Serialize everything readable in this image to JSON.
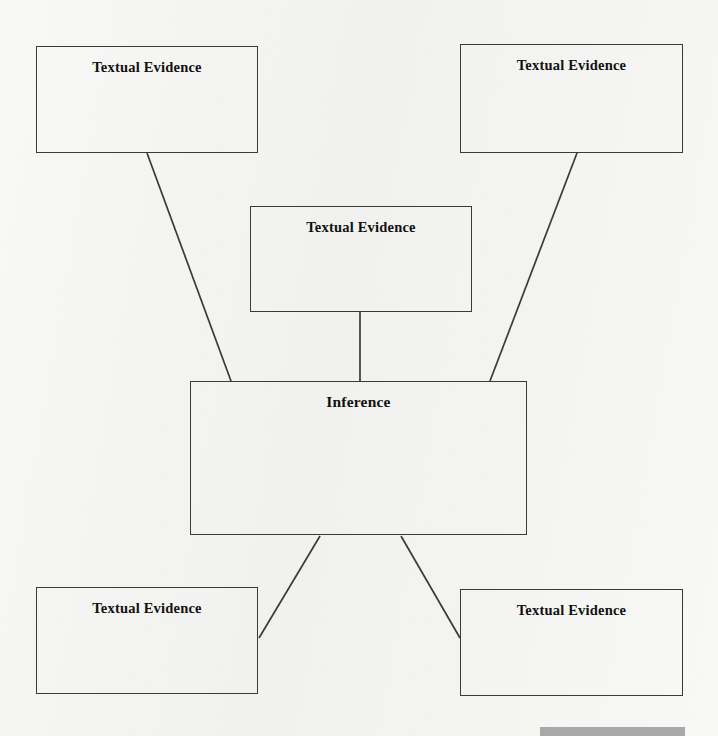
{
  "page": {
    "background_color": "#f3f3f1",
    "width": 718,
    "height": 736,
    "ink_color": "#3a3a3a",
    "text_color": "#111111"
  },
  "diagram": {
    "type": "inference-graphic-organizer",
    "title_label": "Inference",
    "evidence_label": "Textual Evidence",
    "nodes": [
      {
        "id": "evidence-top-left",
        "label": "Textual Evidence",
        "x": 36,
        "y": 46,
        "w": 222,
        "h": 107
      },
      {
        "id": "evidence-top-right",
        "label": "Textual Evidence",
        "x": 460,
        "y": 44,
        "w": 223,
        "h": 109
      },
      {
        "id": "evidence-middle",
        "label": "Textual Evidence",
        "x": 250,
        "y": 206,
        "w": 222,
        "h": 106
      },
      {
        "id": "inference-center",
        "label": "Inference",
        "x": 190,
        "y": 381,
        "w": 337,
        "h": 154
      },
      {
        "id": "evidence-bottom-left",
        "label": "Textual Evidence",
        "x": 36,
        "y": 587,
        "w": 222,
        "h": 107
      },
      {
        "id": "evidence-bottom-right",
        "label": "Textual Evidence",
        "x": 460,
        "y": 589,
        "w": 223,
        "h": 107
      }
    ],
    "connectors": [
      {
        "id": "connector-top-left-to-inference",
        "from": "evidence-top-left",
        "to": "inference-center",
        "x1": 147,
        "y1": 153,
        "x2": 231,
        "y2": 381
      },
      {
        "id": "connector-top-right-to-inference",
        "from": "evidence-top-right",
        "to": "inference-center",
        "x1": 577,
        "y1": 153,
        "x2": 490,
        "y2": 381
      },
      {
        "id": "connector-middle-to-inference",
        "from": "evidence-middle",
        "to": "inference-center",
        "x1": 360,
        "y1": 312,
        "x2": 360,
        "y2": 381
      },
      {
        "id": "connector-inference-to-bottom-left",
        "from": "inference-center",
        "to": "evidence-bottom-left",
        "x1": 320,
        "y1": 536,
        "x2": 259,
        "y2": 638
      },
      {
        "id": "connector-inference-to-bottom-right",
        "from": "inference-center",
        "to": "evidence-bottom-right",
        "x1": 401,
        "y1": 536,
        "x2": 460,
        "y2": 638
      }
    ]
  },
  "footer": {
    "bar": {
      "x": 540,
      "y": 727,
      "w": 145,
      "h": 9,
      "color": "#a8a8a8"
    }
  }
}
